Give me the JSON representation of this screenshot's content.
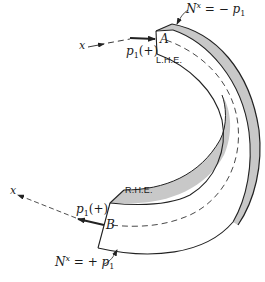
{
  "diagram": {
    "type": "curved beam / shell element free-body diagram",
    "colors": {
      "line": "#222222",
      "shade": "#c8c8c8",
      "background": "#ffffff"
    },
    "labels": {
      "top_normal_force": {
        "symbol": "N",
        "sup": "x",
        "rhs": "= − p",
        "sub": "1"
      },
      "bottom_normal_force": {
        "symbol": "N",
        "sup": "x",
        "rhs": "= + p",
        "sub": "1"
      },
      "top_load": {
        "symbol": "p",
        "sub": "1",
        "sign": "(+)"
      },
      "bottom_load": {
        "symbol": "p",
        "sub": "1",
        "sign": "(+)"
      },
      "point_a": "A",
      "point_b": "B",
      "left_hand_end": "L.H.E.",
      "right_hand_end": "R.H.E.",
      "axis_top": "x",
      "axis_bottom": "x"
    }
  }
}
